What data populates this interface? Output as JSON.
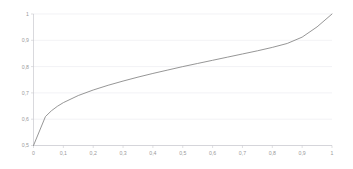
{
  "chart_data": {
    "type": "line",
    "title": "",
    "subtitle": "",
    "xlabel": "",
    "ylabel": "",
    "xlim": [
      0,
      1
    ],
    "ylim": [
      0.5,
      1
    ],
    "grid": "horizontal",
    "legend": "none",
    "decimal_separator": ",",
    "x_tick_labels": [
      "0",
      "0,1",
      "0,2",
      "0,3",
      "0,4",
      "0,5",
      "0,6",
      "0,7",
      "0,8",
      "0,9",
      "1"
    ],
    "x_tick_values": [
      0,
      0.1,
      0.2,
      0.3,
      0.4,
      0.5,
      0.6,
      0.7,
      0.8,
      0.9,
      1
    ],
    "y_tick_labels": [
      "0,5",
      "0,6",
      "0,7",
      "0,8",
      "0,9",
      "1"
    ],
    "y_tick_values": [
      0.5,
      0.6,
      0.7,
      0.8,
      0.9,
      1
    ],
    "series": [
      {
        "name": "curve",
        "color": "#8a8a8a",
        "x": [
          0,
          0.04,
          0.06,
          0.08,
          0.1,
          0.15,
          0.2,
          0.25,
          0.3,
          0.35,
          0.4,
          0.45,
          0.5,
          0.55,
          0.6,
          0.65,
          0.7,
          0.75,
          0.8,
          0.85,
          0.9,
          0.95,
          1
        ],
        "values": [
          0.5,
          0.61,
          0.632,
          0.649,
          0.663,
          0.69,
          0.711,
          0.729,
          0.745,
          0.76,
          0.774,
          0.787,
          0.8,
          0.812,
          0.824,
          0.836,
          0.848,
          0.86,
          0.873,
          0.888,
          0.912,
          0.951,
          1
        ]
      }
    ],
    "annotations": []
  },
  "colors": {
    "background": "#ffffff",
    "grid": "#e9e9ee",
    "axis": "#c9c9cf",
    "tick_label": "#9a9a9a",
    "series": "#8a8a8a"
  }
}
